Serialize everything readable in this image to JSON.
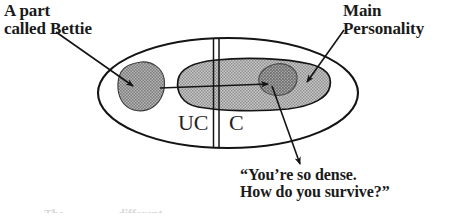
{
  "diagram": {
    "title_alt": "Psyche diagram with unconscious and conscious regions",
    "labels": {
      "bettie": "A part\ncalled Bettie",
      "main_personality": "Main\nPersonality",
      "quote": "“You’re so dense.\nHow do you survive?”",
      "region_unconscious": "UC",
      "region_conscious": "C"
    },
    "faint_bottom": {
      "left_fragment": "The",
      "right_fragment": "different"
    },
    "colors": {
      "ink": "#1a1a1a",
      "outline": "#111111",
      "mass_fill": "#b4b4b4",
      "blob_fill": "#9a9a9a",
      "inner_blob_fill": "#8a8a8a",
      "background": "#ffffff"
    },
    "shapes": {
      "outer_ellipse": {
        "cx": 228,
        "cy": 93,
        "rx": 130,
        "ry": 55
      },
      "divider_x": [
        213,
        219
      ],
      "bettie_blob": {
        "cx": 141,
        "cy": 86,
        "r": 24
      },
      "main_mass": {
        "cx": 252,
        "cy": 86,
        "rx": 80,
        "ry": 27
      },
      "inner_blob": {
        "cx": 278,
        "cy": 80,
        "r": 17
      }
    }
  }
}
